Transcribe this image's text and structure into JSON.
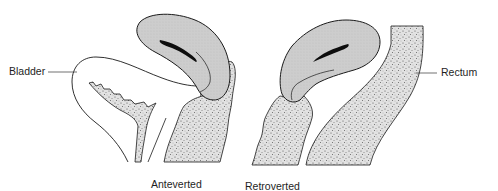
{
  "diagram": {
    "labels": {
      "bladder": "Bladder",
      "rectum": "Rectum",
      "anteverted": "Anteverted",
      "retroverted": "Retroverted"
    },
    "panels": [
      {
        "name": "anteverted",
        "caption": "Anteverted",
        "structures": [
          "bladder",
          "uterus",
          "uterine-cavity",
          "cervix-vagina"
        ]
      },
      {
        "name": "retroverted",
        "caption": "Retroverted",
        "structures": [
          "uterus",
          "uterine-cavity",
          "cervix-vagina",
          "rectum"
        ]
      }
    ],
    "colors": {
      "outline": "#1a1a1a",
      "uterus_fill": "#c8c8c8",
      "stipple_fill": "#d9d9d9",
      "cavity": "#0d0d0d",
      "background": "#ffffff"
    }
  }
}
